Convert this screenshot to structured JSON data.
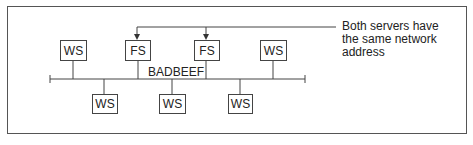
{
  "diagram": {
    "network_label": "BADBEEF",
    "annotation": {
      "lines": [
        "Both servers have",
        "the same network",
        "address"
      ]
    },
    "nodes_top": [
      {
        "id": "ws-top-1",
        "label": "WS",
        "type": "workstation"
      },
      {
        "id": "fs-1",
        "label": "FS",
        "type": "file-server"
      },
      {
        "id": "fs-2",
        "label": "FS",
        "type": "file-server"
      },
      {
        "id": "ws-top-2",
        "label": "WS",
        "type": "workstation"
      }
    ],
    "nodes_bottom": [
      {
        "id": "ws-bottom-1",
        "label": "WS",
        "type": "workstation"
      },
      {
        "id": "ws-bottom-2",
        "label": "WS",
        "type": "workstation"
      },
      {
        "id": "ws-bottom-3",
        "label": "WS",
        "type": "workstation"
      }
    ],
    "colors": {
      "line": "#444444",
      "background": "#ffffff",
      "text": "#222222"
    }
  }
}
